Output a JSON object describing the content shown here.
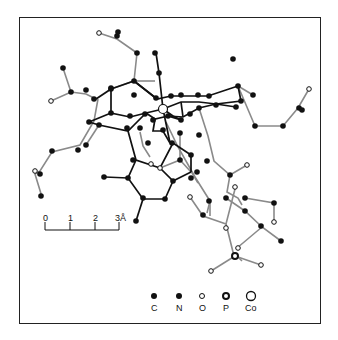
{
  "figure": {
    "type": "molecular-structure",
    "scale_bar": {
      "ticks": [
        "0",
        "1",
        "2",
        "3Å"
      ],
      "unit": "Å"
    },
    "legend": {
      "items": [
        {
          "element": "C",
          "label": "C",
          "style": "filled-small"
        },
        {
          "element": "N",
          "label": "N",
          "style": "filled-small"
        },
        {
          "element": "O",
          "label": "O",
          "style": "open-small"
        },
        {
          "element": "P",
          "label": "P",
          "style": "open-thick"
        },
        {
          "element": "Co",
          "label": "Co",
          "style": "open-large"
        }
      ]
    },
    "colors": {
      "bond_dark": "#111111",
      "bond_light": "#8a8a8a",
      "atom_fill": "#111111",
      "open_fill": "#ffffff"
    }
  }
}
